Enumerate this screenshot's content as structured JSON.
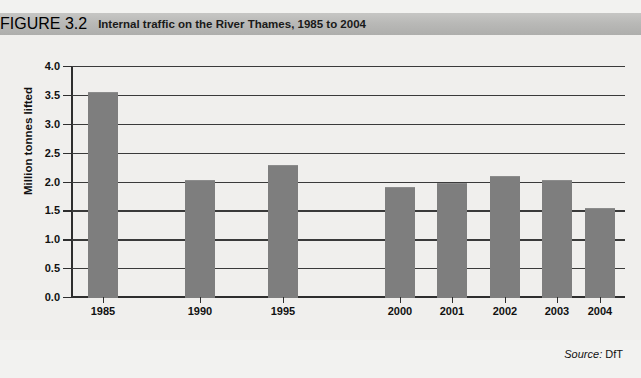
{
  "figure": {
    "number_label": "FIGURE 3.2",
    "title": "Internal traffic on the River Thames, 1985 to 2004"
  },
  "source": {
    "label": "Source:",
    "value": "DfT"
  },
  "colors": {
    "bar": "#7e7e7e",
    "titlebar": "#b9b9b7",
    "plot_background": "#f0efed",
    "axis": "#2e2e2e"
  },
  "chart_data": {
    "type": "bar",
    "title": "Internal traffic on the River Thames, 1985 to 2004",
    "xlabel": "",
    "ylabel": "Million tonnes lifted",
    "categories": [
      "1985",
      "1990",
      "1995",
      "2000",
      "2001",
      "2002",
      "2003",
      "2004"
    ],
    "values": [
      3.55,
      2.03,
      2.28,
      1.91,
      1.98,
      2.1,
      2.03,
      1.54
    ],
    "ylim": [
      0.0,
      4.0
    ],
    "ytick_values": [
      0.0,
      0.5,
      1.0,
      1.5,
      2.0,
      2.5,
      3.0,
      3.5,
      4.0
    ],
    "ytick_labels": [
      "0.0",
      "0.5",
      "1.0",
      "1.5",
      "2.0",
      "2.5",
      "3.0",
      "3.5",
      "4.0"
    ],
    "grid": true,
    "legend": false,
    "note": "Category spacing is uneven: 1985, 1990 and 1995 are spaced at five-year intervals while 2000-2004 are annual."
  }
}
